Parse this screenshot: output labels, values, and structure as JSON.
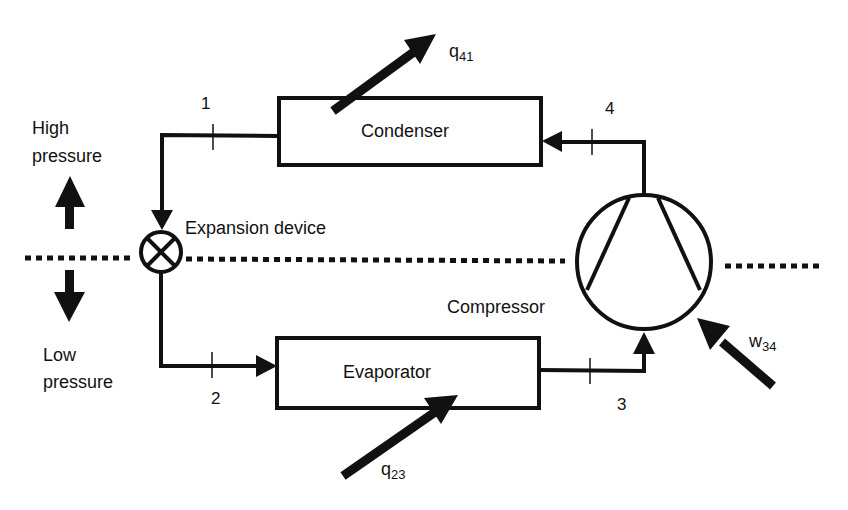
{
  "diagram": {
    "components": {
      "condenser": "Condenser",
      "evaporator": "Evaporator",
      "expansion_device": "Expansion device",
      "compressor": "Compressor"
    },
    "regions": {
      "high_line1": "High",
      "high_line2": "pressure",
      "low_line1": "Low",
      "low_line2": "pressure"
    },
    "state_points": {
      "p1": "1",
      "p2": "2",
      "p3": "3",
      "p4": "4"
    },
    "energy_flows": {
      "q41_base": "q",
      "q41_sub": "41",
      "q23_base": "q",
      "q23_sub": "23",
      "w34_base": "w",
      "w34_sub": "34"
    },
    "colors": {
      "line": "#111111",
      "background": "#ffffff"
    }
  }
}
